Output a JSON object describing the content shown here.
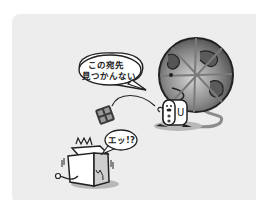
{
  "scene": {
    "background_color": "#ededed",
    "speech_bubble_server": {
      "line1": "この宛先",
      "line2": "見つかんない"
    },
    "speech_bubble_pc": {
      "text": "エッ!?"
    },
    "pc_label": "U",
    "server_label": "U"
  }
}
